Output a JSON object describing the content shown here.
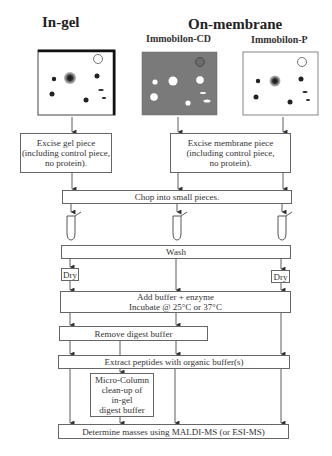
{
  "headers": {
    "in_gel": "In-gel",
    "on_membrane": "On-membrane",
    "immobilon_cd": "Immobilon-CD",
    "immobilon_p": "Immobilon-P"
  },
  "panels": [
    {
      "name": "in-gel-panel",
      "background": "#ffffff",
      "spot_color": "#222222"
    },
    {
      "name": "immobilon-cd-panel",
      "background": "#7a7a7a",
      "spot_color": "#ffffff"
    },
    {
      "name": "immobilon-p-panel",
      "background": "#ffffff",
      "spot_color": "#222222"
    }
  ],
  "steps": {
    "excise_gel": "Excise gel piece\n(including control piece,\nno protein).",
    "excise_membrane": "Excise membrane piece\n(including control piece,\nno protein).",
    "chop": "Chop into small pieces.",
    "wash": "Wash",
    "dry_left": "Dry",
    "dry_right": "Dry",
    "add_buffer": "Add buffer + enzyme\nIncubate @ 25°C or 37°C",
    "remove_digest": "Remove digest buffer",
    "extract": "Extract peptides with organic buffer(s)",
    "micro_column": "Micro-Column\nclean-up of\nin-gel\ndigest buffer",
    "determine": "Determine masses using MALDI-MS (or ESI-MS)"
  }
}
